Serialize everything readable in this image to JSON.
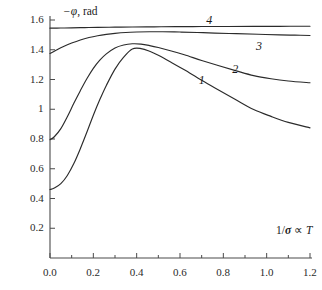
{
  "chart_data": {
    "type": "line",
    "title": "",
    "subtitle": "",
    "xlabel": "1/σ ∝ T",
    "ylabel": "−φ, rad",
    "xlim": [
      0.0,
      1.2
    ],
    "ylim": [
      0.0,
      1.6
    ],
    "grid": false,
    "legend_position": "inline-curve-labels",
    "x_ticks_major": [
      0.0,
      0.2,
      0.4,
      0.6,
      0.8,
      1.0,
      1.2
    ],
    "x_tick_labels": [
      "0.0",
      "0.2",
      "0.4",
      "0.6",
      "0.8",
      "1.0",
      "1.2"
    ],
    "x_ticks_minor": [
      0.1,
      0.3,
      0.5,
      0.7,
      0.9,
      1.1
    ],
    "y_ticks_major": [
      0.2,
      0.4,
      0.6,
      0.8,
      1.0,
      1.2,
      1.4,
      1.6
    ],
    "y_tick_labels": [
      "0.2",
      "0.4",
      "0.6",
      "0.8",
      "1",
      "1.2",
      "1.4",
      "1.6"
    ],
    "series": [
      {
        "name": "1",
        "label": "1",
        "color": "#2b2b2b",
        "x": [
          0.0,
          0.02,
          0.05,
          0.08,
          0.11,
          0.14,
          0.17,
          0.2,
          0.23,
          0.26,
          0.3,
          0.34,
          0.38,
          0.42,
          0.46,
          0.5,
          0.56,
          0.62,
          0.7,
          0.78,
          0.86,
          0.94,
          1.02,
          1.1,
          1.2
        ],
        "y": [
          0.46,
          0.47,
          0.5,
          0.555,
          0.635,
          0.735,
          0.845,
          0.96,
          1.065,
          1.16,
          1.27,
          1.35,
          1.405,
          1.408,
          1.39,
          1.363,
          1.315,
          1.265,
          1.195,
          1.128,
          1.062,
          0.998,
          0.952,
          0.912,
          0.875
        ]
      },
      {
        "name": "2",
        "label": "2",
        "color": "#2b2b2b",
        "x": [
          0.0,
          0.02,
          0.05,
          0.08,
          0.11,
          0.14,
          0.17,
          0.2,
          0.23,
          0.26,
          0.3,
          0.34,
          0.38,
          0.42,
          0.46,
          0.5,
          0.56,
          0.62,
          0.7,
          0.78,
          0.86,
          0.94,
          1.02,
          1.1,
          1.2
        ],
        "y": [
          0.795,
          0.815,
          0.87,
          0.95,
          1.04,
          1.125,
          1.205,
          1.275,
          1.33,
          1.372,
          1.412,
          1.432,
          1.44,
          1.438,
          1.428,
          1.415,
          1.392,
          1.366,
          1.328,
          1.292,
          1.258,
          1.226,
          1.205,
          1.19,
          1.178
        ]
      },
      {
        "name": "3",
        "label": "3",
        "color": "#2b2b2b",
        "x": [
          0.0,
          0.03,
          0.06,
          0.1,
          0.14,
          0.18,
          0.22,
          0.26,
          0.3,
          0.35,
          0.4,
          0.46,
          0.52,
          0.6,
          0.68,
          0.76,
          0.86,
          0.96,
          1.06,
          1.13,
          1.2
        ],
        "y": [
          1.375,
          1.398,
          1.42,
          1.445,
          1.466,
          1.482,
          1.494,
          1.503,
          1.51,
          1.516,
          1.519,
          1.521,
          1.521,
          1.519,
          1.516,
          1.512,
          1.508,
          1.504,
          1.5,
          1.498,
          1.496
        ]
      },
      {
        "name": "4",
        "label": "4",
        "color": "#2b2b2b",
        "x": [
          0.0,
          0.05,
          0.1,
          0.16,
          0.22,
          0.3,
          0.38,
          0.48,
          0.58,
          0.7,
          0.82,
          0.94,
          1.06,
          1.13,
          1.2
        ],
        "y": [
          1.545,
          1.546,
          1.547,
          1.549,
          1.55,
          1.552,
          1.553,
          1.554,
          1.555,
          1.556,
          1.556,
          1.557,
          1.557,
          1.558,
          1.558
        ]
      }
    ],
    "curve_label_positions": [
      {
        "label": "1",
        "x": 0.7,
        "y": 1.195
      },
      {
        "label": "2",
        "x": 0.855,
        "y": 1.268
      },
      {
        "label": "3",
        "x": 0.965,
        "y": 1.425
      },
      {
        "label": "4",
        "x": 0.735,
        "y": 1.6
      }
    ]
  }
}
